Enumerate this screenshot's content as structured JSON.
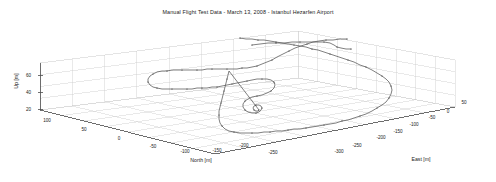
{
  "figure": {
    "title": "Manual Flight Test Data - March 13, 2008 - Istanbul Hezarfen Airport",
    "background": "#ffffff",
    "grid_color": "#c9c9c9",
    "axis_color": "#4d4d4d",
    "trace_color": "#555555",
    "marker_color": "#333333",
    "text_color": "#1a1a1a"
  },
  "axes": {
    "north": {
      "label": "North [m]",
      "ticks": [
        100,
        50,
        0,
        -50,
        -100,
        -150,
        -200,
        -250
      ],
      "tick_labels": [
        "100",
        "50",
        "0",
        "-50",
        "-100",
        "-150",
        "-200",
        "-250"
      ],
      "range": [
        125,
        -275
      ]
    },
    "east": {
      "label": "East [m]",
      "ticks": [
        -300,
        -250,
        -200,
        -150,
        -100,
        -50,
        0,
        50
      ],
      "tick_labels": [
        "-300",
        "-250",
        "-200",
        "-150",
        "-100",
        "-50",
        "0",
        "50"
      ],
      "range": [
        -325,
        75
      ]
    },
    "up": {
      "label": "Up [m]",
      "ticks": [
        20,
        40,
        60
      ],
      "tick_labels": [
        "20",
        "40",
        "60"
      ],
      "range": [
        0,
        75
      ]
    }
  },
  "chart_data": {
    "type": "line",
    "title": "Manual Flight Test Data - March 13, 2008 - Istanbul Hezarfen Airport",
    "xlabel": "North [m]",
    "ylabel": "East [m]",
    "zlabel": "Up [m]",
    "grid": true,
    "legend": null,
    "projection": "3d",
    "series": [
      {
        "name": "Flight trajectory",
        "style": "line-with-dot-markers",
        "color": "#555555",
        "screen_path": [
          [
            347,
            39
          ],
          [
            340,
            39
          ],
          [
            333,
            40
          ],
          [
            326,
            40
          ],
          [
            319,
            41
          ],
          [
            313,
            42
          ],
          [
            307,
            44
          ],
          [
            301,
            46
          ],
          [
            295,
            48
          ],
          [
            289,
            51
          ],
          [
            283,
            54
          ],
          [
            277,
            57
          ],
          [
            272,
            60
          ],
          [
            267,
            62
          ],
          [
            262,
            64
          ],
          [
            257,
            66
          ],
          [
            252,
            67
          ],
          [
            247,
            68
          ],
          [
            242,
            68
          ],
          [
            237,
            69
          ],
          [
            232,
            69
          ],
          [
            227,
            69
          ],
          [
            222,
            69
          ],
          [
            217,
            69
          ],
          [
            212,
            69
          ],
          [
            207,
            69
          ],
          [
            202,
            70
          ],
          [
            197,
            70
          ],
          [
            192,
            70
          ],
          [
            187,
            70
          ],
          [
            182,
            70
          ],
          [
            177,
            70
          ],
          [
            172,
            70
          ],
          [
            167,
            71
          ],
          [
            162,
            71
          ],
          [
            157,
            72
          ],
          [
            153,
            74
          ],
          [
            150,
            76
          ],
          [
            148,
            79
          ],
          [
            148,
            82
          ],
          [
            150,
            85
          ],
          [
            153,
            87
          ],
          [
            157,
            88
          ],
          [
            162,
            89
          ],
          [
            167,
            89
          ],
          [
            172,
            89
          ],
          [
            177,
            89
          ],
          [
            182,
            89
          ],
          [
            187,
            89
          ],
          [
            192,
            89
          ],
          [
            197,
            88
          ],
          [
            202,
            88
          ],
          [
            207,
            88
          ],
          [
            212,
            87
          ],
          [
            217,
            87
          ],
          [
            222,
            86
          ],
          [
            227,
            85
          ],
          [
            232,
            84
          ],
          [
            237,
            83
          ],
          [
            242,
            82
          ],
          [
            247,
            81
          ],
          [
            252,
            80
          ],
          [
            257,
            79
          ],
          [
            262,
            79
          ],
          [
            267,
            79
          ],
          [
            271,
            80
          ],
          [
            274,
            82
          ],
          [
            275,
            85
          ],
          [
            274,
            88
          ],
          [
            271,
            91
          ],
          [
            267,
            93
          ],
          [
            262,
            95
          ],
          [
            257,
            96
          ],
          [
            252,
            97
          ],
          [
            248,
            99
          ],
          [
            245,
            101
          ],
          [
            243,
            104
          ],
          [
            243,
            107
          ],
          [
            245,
            110
          ],
          [
            248,
            112
          ],
          [
            252,
            113
          ],
          [
            256,
            113
          ],
          [
            259,
            112
          ],
          [
            261,
            110
          ],
          [
            262,
            108
          ],
          [
            261,
            106
          ],
          [
            259,
            105
          ],
          [
            256,
            105
          ],
          [
            254,
            106
          ],
          [
            253,
            108
          ],
          [
            254,
            110
          ],
          [
            256,
            111
          ],
          [
            258,
            111
          ],
          [
            259,
            110
          ],
          [
            229,
            71
          ],
          [
            228,
            75
          ],
          [
            227,
            79
          ],
          [
            226,
            83
          ],
          [
            225,
            87
          ],
          [
            224,
            91
          ],
          [
            223,
            95
          ],
          [
            222,
            99
          ],
          [
            221,
            103
          ],
          [
            220,
            107
          ],
          [
            219,
            111
          ],
          [
            219,
            115
          ],
          [
            219,
            119
          ],
          [
            220,
            123
          ],
          [
            222,
            126
          ],
          [
            225,
            129
          ],
          [
            229,
            131
          ],
          [
            234,
            132
          ],
          [
            240,
            133
          ],
          [
            246,
            133
          ],
          [
            252,
            133
          ],
          [
            258,
            133
          ],
          [
            264,
            132
          ],
          [
            270,
            132
          ],
          [
            276,
            131
          ],
          [
            282,
            131
          ],
          [
            288,
            130
          ],
          [
            294,
            129
          ],
          [
            300,
            129
          ],
          [
            306,
            128
          ],
          [
            312,
            127
          ],
          [
            318,
            126
          ],
          [
            324,
            125
          ],
          [
            330,
            124
          ],
          [
            336,
            123
          ],
          [
            342,
            121
          ],
          [
            348,
            120
          ],
          [
            354,
            118
          ],
          [
            360,
            116
          ],
          [
            366,
            114
          ],
          [
            372,
            111
          ],
          [
            377,
            108
          ],
          [
            382,
            105
          ],
          [
            386,
            102
          ],
          [
            389,
            98
          ],
          [
            391,
            94
          ],
          [
            392,
            90
          ],
          [
            391,
            86
          ],
          [
            389,
            82
          ],
          [
            386,
            79
          ],
          [
            382,
            76
          ],
          [
            377,
            73
          ],
          [
            372,
            70
          ],
          [
            366,
            67
          ],
          [
            360,
            65
          ],
          [
            354,
            62
          ],
          [
            348,
            60
          ],
          [
            342,
            58
          ],
          [
            336,
            56
          ],
          [
            330,
            54
          ],
          [
            324,
            52
          ],
          [
            318,
            50
          ],
          [
            312,
            49
          ],
          [
            306,
            47
          ],
          [
            300,
            46
          ],
          [
            294,
            45
          ],
          [
            288,
            44
          ],
          [
            282,
            43
          ],
          [
            276,
            42
          ],
          [
            270,
            41
          ],
          [
            264,
            40
          ],
          [
            258,
            40
          ],
          [
            252,
            39
          ],
          [
            246,
            39
          ],
          [
            240,
            38
          ]
        ],
        "segment2": [
          [
            252,
            45
          ],
          [
            260,
            44
          ],
          [
            268,
            43
          ],
          [
            276,
            43
          ],
          [
            284,
            43
          ],
          [
            292,
            42
          ],
          [
            300,
            42
          ],
          [
            308,
            42
          ],
          [
            316,
            42
          ],
          [
            324,
            42
          ],
          [
            330,
            43
          ],
          [
            334,
            45
          ],
          [
            337,
            47
          ],
          [
            341,
            48
          ],
          [
            346,
            49
          ],
          [
            351,
            49
          ]
        ]
      }
    ]
  },
  "geometry": {
    "floor_quad": [
      [
        40,
        110
      ],
      [
        215,
        154
      ],
      [
        455,
        107
      ],
      [
        298,
        78
      ]
    ],
    "top_quad": [
      [
        40,
        63
      ],
      [
        215,
        107
      ],
      [
        455,
        60
      ],
      [
        298,
        31
      ]
    ],
    "z_axis": [
      [
        40,
        110
      ],
      [
        40,
        63
      ]
    ],
    "north_axis": [
      [
        40,
        110
      ],
      [
        215,
        154
      ]
    ],
    "east_axis": [
      [
        215,
        154
      ],
      [
        455,
        107
      ]
    ],
    "north_tick_pos": [
      {
        "x": 47,
        "y": 122,
        "t": "100"
      },
      {
        "x": 84,
        "y": 131,
        "t": "50"
      },
      {
        "x": 119,
        "y": 140,
        "t": "0"
      },
      {
        "x": 153,
        "y": 148,
        "t": "-50"
      },
      {
        "x": 185,
        "y": 153,
        "t": "-100"
      },
      {
        "x": 217,
        "y": 152,
        "t": "-150"
      },
      {
        "x": 244,
        "y": 147,
        "t": "-200"
      },
      {
        "x": 273,
        "y": 154,
        "t": "-250"
      }
    ],
    "east_tick_pos": [
      {
        "x": 339,
        "y": 153,
        "t": "-300"
      },
      {
        "x": 357,
        "y": 147,
        "t": "-250"
      },
      {
        "x": 381,
        "y": 139,
        "t": "-200"
      },
      {
        "x": 398,
        "y": 133,
        "t": "-150"
      },
      {
        "x": 414,
        "y": 126,
        "t": "-100"
      },
      {
        "x": 432,
        "y": 119,
        "t": "-50"
      },
      {
        "x": 448,
        "y": 113,
        "t": "0"
      },
      {
        "x": 464,
        "y": 104,
        "t": "50"
      }
    ],
    "up_tick_pos": [
      {
        "x": 31,
        "y": 75,
        "t": "60"
      },
      {
        "x": 31,
        "y": 92,
        "t": "40"
      },
      {
        "x": 31,
        "y": 109,
        "t": "20"
      }
    ]
  }
}
